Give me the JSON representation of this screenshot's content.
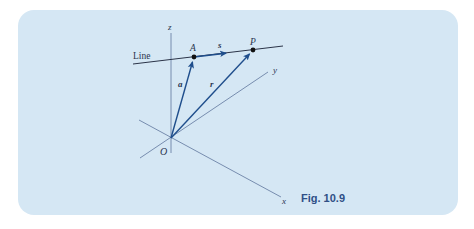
{
  "figure": {
    "caption": "Fig. 10.9",
    "labels": {
      "line": "Line",
      "z_axis": "z",
      "y_axis": "y",
      "x_axis": "x",
      "origin": "O",
      "point_a": "A",
      "point_p": "P",
      "vector_a": "a",
      "vector_r": "r",
      "vector_s": "s"
    },
    "colors": {
      "panel_background": "#d5e7f4",
      "page_background": "#ffffff",
      "axis": "#6c82a6",
      "line": "#2b3448",
      "vector": "#1f4e8c",
      "point": "#111111",
      "caption": "#2f4f86"
    }
  }
}
